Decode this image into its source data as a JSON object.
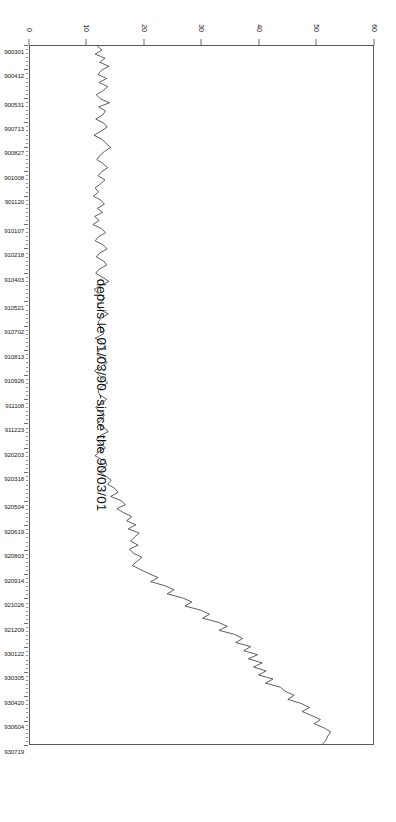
{
  "chart_data": {
    "type": "line",
    "title": "depuis le 01/03/90 -since the 90/03/01",
    "xlabel": "",
    "ylabel": "",
    "ylim": [
      0,
      60
    ],
    "yticks": [
      0,
      10,
      20,
      30,
      40,
      50,
      60
    ],
    "ytick_labels": [
      "0",
      "10",
      "20",
      "30",
      "40",
      "50",
      "60"
    ],
    "grid": false,
    "legend": null,
    "orientation": "page-rotated-90",
    "line_color": "#1a1a1a",
    "xtick_labels": [
      "900301",
      "900412",
      "900531",
      "900713",
      "900827",
      "901008",
      "901120",
      "910107",
      "910218",
      "910403",
      "910521",
      "910702",
      "910813",
      "910926",
      "911108",
      "911223",
      "920203",
      "920318",
      "920504",
      "920619",
      "920803",
      "920914",
      "921026",
      "921209",
      "930122",
      "930305",
      "930420",
      "930604",
      "930719"
    ],
    "x": [
      "900301",
      "900308",
      "900315",
      "900322",
      "900329",
      "900405",
      "900412",
      "900419",
      "900426",
      "900503",
      "900510",
      "900517",
      "900524",
      "900531",
      "900607",
      "900614",
      "900621",
      "900628",
      "900705",
      "900713",
      "900720",
      "900727",
      "900803",
      "900810",
      "900817",
      "900827",
      "900903",
      "900910",
      "900917",
      "900924",
      "901001",
      "901008",
      "901015",
      "901022",
      "901029",
      "901105",
      "901112",
      "901120",
      "901127",
      "901204",
      "901211",
      "901218",
      "901226",
      "910102",
      "910107",
      "910114",
      "910121",
      "910128",
      "910204",
      "910211",
      "910218",
      "910225",
      "910304",
      "910311",
      "910318",
      "910325",
      "910403",
      "910410",
      "910417",
      "910424",
      "910501",
      "910508",
      "910515",
      "910521",
      "910528",
      "910604",
      "910611",
      "910618",
      "910625",
      "910702",
      "910709",
      "910716",
      "910723",
      "910730",
      "910806",
      "910813",
      "910820",
      "910827",
      "910903",
      "910910",
      "910917",
      "910926",
      "911003",
      "911010",
      "911017",
      "911024",
      "911031",
      "911108",
      "911115",
      "911122",
      "911129",
      "911206",
      "911213",
      "911223",
      "911230",
      "920106",
      "920113",
      "920120",
      "920127",
      "920203",
      "920210",
      "920217",
      "920224",
      "920302",
      "920309",
      "920318",
      "920325",
      "920401",
      "920408",
      "920415",
      "920422",
      "920429",
      "920504",
      "920511",
      "920518",
      "920525",
      "920601",
      "920608",
      "920619",
      "920626",
      "920703",
      "920710",
      "920717",
      "920724",
      "920803",
      "920810",
      "920817",
      "920824",
      "920831",
      "920907",
      "920914",
      "920921",
      "920928",
      "921005",
      "921012",
      "921019",
      "921026",
      "921102",
      "921109",
      "921116",
      "921123",
      "921130",
      "921209",
      "921216",
      "921223",
      "921230",
      "930106",
      "930113",
      "930122",
      "930129",
      "930205",
      "930212",
      "930219",
      "930226",
      "930305",
      "930312",
      "930319",
      "930326",
      "930402",
      "930412",
      "930420",
      "930427",
      "930504",
      "930511",
      "930518",
      "930525",
      "930604",
      "930611",
      "930618",
      "930625",
      "930702",
      "930709",
      "930719"
    ],
    "values": [
      11.8,
      12.6,
      11.4,
      13.1,
      12.2,
      13.8,
      12.5,
      11.9,
      13.4,
      12.1,
      13.6,
      12.8,
      11.6,
      12.3,
      13.9,
      12.0,
      13.2,
      12.7,
      11.5,
      12.9,
      13.5,
      12.4,
      11.2,
      12.6,
      13.3,
      14.1,
      13.0,
      12.2,
      11.7,
      12.8,
      13.6,
      12.5,
      11.9,
      13.1,
      12.3,
      11.4,
      12.0,
      11.1,
      12.4,
      13.0,
      11.8,
      12.7,
      11.3,
      12.1,
      11.0,
      12.5,
      13.2,
      12.0,
      11.4,
      12.8,
      13.5,
      12.2,
      11.6,
      12.9,
      13.4,
      12.1,
      11.5,
      12.7,
      13.8,
      12.4,
      11.2,
      12.0,
      13.1,
      12.6,
      11.8,
      12.3,
      13.7,
      12.5,
      11.9,
      12.2,
      13.0,
      12.8,
      11.4,
      12.6,
      13.3,
      12.1,
      11.7,
      12.9,
      13.5,
      12.4,
      11.3,
      12.0,
      12.8,
      13.6,
      12.5,
      11.9,
      12.2,
      13.4,
      12.7,
      11.5,
      12.1,
      13.0,
      12.6,
      11.8,
      12.9,
      13.7,
      12.3,
      11.6,
      12.4,
      13.2,
      12.0,
      11.4,
      12.7,
      13.5,
      12.9,
      12.1,
      13.3,
      14.2,
      13.6,
      14.8,
      15.4,
      14.1,
      15.9,
      16.7,
      15.2,
      16.4,
      17.8,
      16.9,
      18.5,
      17.2,
      19.1,
      18.3,
      17.6,
      18.9,
      17.4,
      18.1,
      19.6,
      18.7,
      17.9,
      19.3,
      20.8,
      22.4,
      21.1,
      23.6,
      25.2,
      24.0,
      26.7,
      28.3,
      27.1,
      29.8,
      31.4,
      30.2,
      32.9,
      34.5,
      33.1,
      35.8,
      37.2,
      36.0,
      38.6,
      37.4,
      39.8,
      38.2,
      40.6,
      39.1,
      41.3,
      40.0,
      42.5,
      41.2,
      43.8,
      44.6,
      46.2,
      45.1,
      47.4,
      48.9,
      47.6,
      49.3,
      50.8,
      49.7,
      51.4,
      52.6,
      52.1,
      51.8,
      51.2
    ]
  }
}
